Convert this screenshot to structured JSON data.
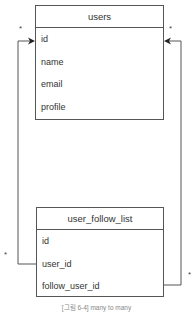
{
  "diagram": {
    "type": "er-diagram",
    "entities": [
      {
        "name": "users",
        "fields": [
          "id",
          "name",
          "email",
          "profile"
        ]
      },
      {
        "name": "user_follow_list",
        "fields": [
          "id",
          "user_id",
          "follow_user_id"
        ]
      }
    ],
    "relationships": [
      {
        "from": "user_follow_list.user_id",
        "to": "users.id",
        "from_multiplicity": "*",
        "to_multiplicity": "*"
      },
      {
        "from": "user_follow_list.follow_user_id",
        "to": "users.id",
        "from_multiplicity": "*",
        "to_multiplicity": "*"
      }
    ],
    "multiplicity_labels": {
      "users_left": "*",
      "users_right": "*",
      "follow_left": "*",
      "follow_right": "*"
    },
    "caption": "[그림 6-4] many to many",
    "colors": {
      "line": "#555555",
      "text": "#333333",
      "caption": "#888888"
    }
  }
}
